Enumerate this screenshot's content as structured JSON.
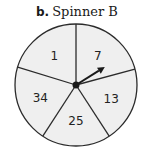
{
  "title": {
    "label": "b.",
    "text": "Spinner B"
  },
  "spinner": {
    "fill_color": "#efefef",
    "stroke_color": "#2b2b2b",
    "sections": [
      {
        "label": "1"
      },
      {
        "label": "7"
      },
      {
        "label": "13"
      },
      {
        "label": "25"
      },
      {
        "label": "34"
      }
    ],
    "pointer": {
      "points_to": "7"
    }
  }
}
